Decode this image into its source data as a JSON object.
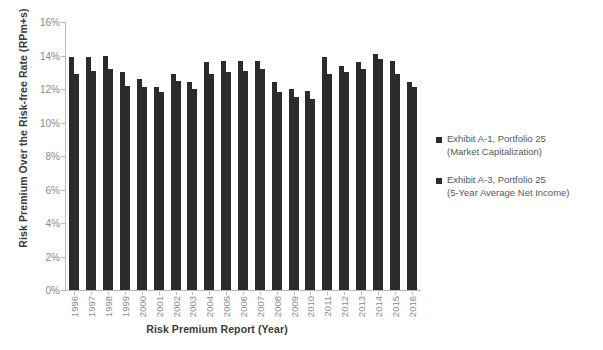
{
  "chart_data": {
    "type": "bar",
    "title": "",
    "xlabel": "Risk Premium Report (Year)",
    "ylabel": "Risk Premium Over the Risk-free Rate (RPm+s)",
    "categories": [
      "1996",
      "1997",
      "1998",
      "1999",
      "2000",
      "2001",
      "2002",
      "2003",
      "2004",
      "2005",
      "2006",
      "2007",
      "2008",
      "2009",
      "2010",
      "2011",
      "2012",
      "2013",
      "2014",
      "2015",
      "2016"
    ],
    "ylim": [
      0,
      16
    ],
    "ytick_labels": [
      "0%",
      "2%",
      "4%",
      "6%",
      "8%",
      "10%",
      "12%",
      "14%",
      "16%"
    ],
    "ytick_values": [
      0,
      2,
      4,
      6,
      8,
      10,
      12,
      14,
      16
    ],
    "grid": false,
    "legend_position": "right",
    "series": [
      {
        "name": "Exhibit A-1, Portfolio 25 (Market Capitalization)",
        "color": "#2b2b2b",
        "values": [
          13.9,
          13.9,
          14.0,
          13.0,
          12.6,
          12.1,
          12.9,
          12.4,
          13.6,
          13.7,
          13.7,
          13.7,
          12.4,
          12.0,
          11.9,
          13.9,
          13.4,
          13.6,
          14.1,
          13.7,
          12.4
        ]
      },
      {
        "name": "Exhibit A-3, Portfolio 25 (5-Year Average Net Income)",
        "color": "#2b2b2b",
        "values": [
          12.9,
          13.1,
          13.2,
          12.2,
          12.1,
          11.8,
          12.5,
          12.0,
          12.9,
          13.0,
          13.1,
          13.2,
          11.8,
          11.5,
          11.4,
          12.9,
          13.0,
          13.2,
          13.8,
          12.9,
          12.1
        ]
      }
    ]
  },
  "legend": {
    "items": [
      {
        "line1": "Exhibit A-1, Portfolio 25",
        "line2": "(Market Capitalization)"
      },
      {
        "line1": "Exhibit A-3, Portfolio 25",
        "line2": "(5-Year Average Net Income)"
      }
    ]
  }
}
